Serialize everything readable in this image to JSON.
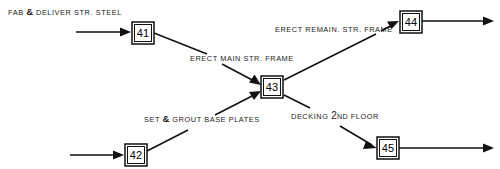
{
  "diagram": {
    "type": "activity-on-arrow-network",
    "nodes": [
      {
        "id": "41",
        "label": "41",
        "x": 132,
        "y": 22
      },
      {
        "id": "42",
        "label": "42",
        "x": 125,
        "y": 144
      },
      {
        "id": "43",
        "label": "43",
        "x": 261,
        "y": 76
      },
      {
        "id": "44",
        "label": "44",
        "x": 400,
        "y": 11
      },
      {
        "id": "45",
        "label": "45",
        "x": 377,
        "y": 137
      }
    ],
    "activities": [
      {
        "id": "fab-deliver-str-steel",
        "text": "FAB & DELIVER STR. STEEL",
        "parts": [
          "FAB ",
          "&",
          " DELIVER STR. STEEL"
        ],
        "to_node": "41",
        "x": 8,
        "y": 6
      },
      {
        "id": "erect-main-str-frame",
        "text": "ERECT MAIN STR. FRAME",
        "parts": [
          "ERECT MAIN STR. FRAME"
        ],
        "from_node": "41",
        "to_node": "43",
        "x": 190,
        "y": 54
      },
      {
        "id": "set-grout-base-plates",
        "text": "SET & GROUT BASE PLATES",
        "parts": [
          "SET ",
          "&",
          " GROUT BASE PLATES"
        ],
        "from_node": "42",
        "to_node": "43",
        "x": 144,
        "y": 113
      },
      {
        "id": "erect-remain-str-frame",
        "text": "ERECT REMAIN. STR. FRAME",
        "parts": [
          "ERECT REMAIN. STR. FRAME"
        ],
        "from_node": "43",
        "to_node": "44",
        "x": 275,
        "y": 25
      },
      {
        "id": "decking-2nd-floor",
        "text": "DECKING 2ND FLOOR",
        "ordinal_number": "2",
        "ordinal_suffix": "ND",
        "parts": [
          "DECKING ",
          "2",
          "ND",
          " FLOOR"
        ],
        "from_node": "43",
        "to_node": "45",
        "x": 291,
        "y": 110
      }
    ],
    "colors": {
      "line": "#111111",
      "text": "#1a1a1a",
      "background": "#ffffff"
    }
  }
}
